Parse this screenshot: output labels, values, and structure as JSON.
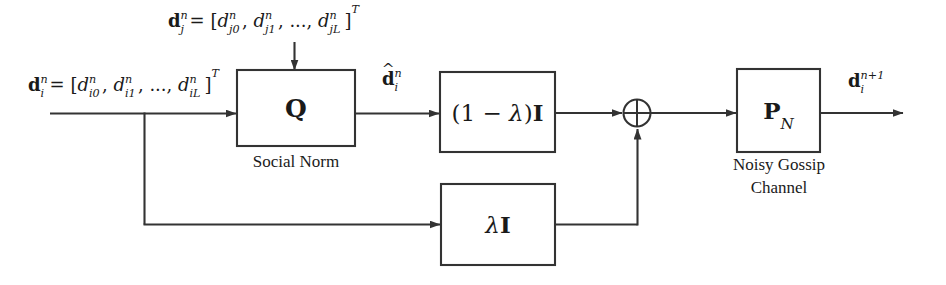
{
  "figure": {
    "type": "block-diagram",
    "background_color": "#ffffff",
    "line_color": "#333333"
  },
  "signals": {
    "input_left": {
      "name": "input-vector-di",
      "text": "d_i^n = [d_{i0}^n, d_{i1}^n, ..., d_{iL}^n]^T",
      "vector": "d",
      "vector_sub": "i",
      "vector_sup": "n",
      "components": [
        "d_{i0}^n",
        "d_{i1}^n",
        "...",
        "d_{iL}^n"
      ],
      "transpose": "T"
    },
    "input_top": {
      "name": "input-vector-dj",
      "text": "d_j^n = [d_{j0}^n, d_{j1}^n, ..., d_{jL}^n]^T",
      "vector": "d",
      "vector_sub": "j",
      "vector_sup": "n",
      "components": [
        "d_{j0}^n",
        "d_{j1}^n",
        "...",
        "d_{jL}^n"
      ],
      "transpose": "T"
    },
    "quantized": {
      "name": "quantized-vector",
      "text": "d-hat_i^n",
      "vector": "d",
      "sub": "i",
      "sup": "n",
      "accent": "hat"
    },
    "output": {
      "name": "output-vector",
      "text": "d_i^{n+1}",
      "vector": "d",
      "sub": "i",
      "sup": "n+1"
    }
  },
  "blocks": [
    {
      "id": "social-norm",
      "label": "Q",
      "label_style": "bold",
      "caption": "Social Norm",
      "caption_lines": [
        "Social Norm"
      ]
    },
    {
      "id": "one-minus-lambda",
      "label": "(1 − λ)I",
      "label_parts": {
        "prefix": "(1 − ",
        "greek": "λ",
        "suffix": ")",
        "matrix": "I"
      },
      "caption": "",
      "caption_lines": []
    },
    {
      "id": "lambda-i",
      "label": "λI",
      "label_parts": {
        "greek": "λ",
        "matrix": "I"
      },
      "caption": "",
      "caption_lines": []
    },
    {
      "id": "noisy-gossip-channel",
      "label": "P_N",
      "label_parts": {
        "matrix": "P",
        "subscript": "N"
      },
      "caption": "Noisy Gossip Channel",
      "caption_lines": [
        "Noisy Gossip",
        "Channel"
      ]
    }
  ],
  "junction": {
    "id": "summing-junction",
    "symbol": "⊕",
    "description": "circle with cross (adder)"
  }
}
